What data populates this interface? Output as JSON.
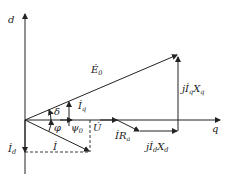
{
  "diagram": {
    "type": "phasor diagram",
    "axes": {
      "d_label": "d",
      "q_label": "q"
    },
    "phasors": [
      {
        "id": "E0",
        "label": "Ė",
        "sub": "0"
      },
      {
        "id": "jIqXq",
        "label": "jİ",
        "sub": "q",
        "suffix": "X",
        "suffix_sub": "q"
      },
      {
        "id": "U",
        "label": "U̇"
      },
      {
        "id": "I",
        "label": "İ"
      },
      {
        "id": "Id",
        "label": "İ",
        "sub": "d"
      },
      {
        "id": "Iq",
        "label": "İ",
        "sub": "q"
      },
      {
        "id": "IRa",
        "label": "İR",
        "sub": "a"
      },
      {
        "id": "jIdXd",
        "label": "jİ",
        "sub": "d",
        "suffix": "X",
        "suffix_sub": "d"
      }
    ],
    "angles": {
      "delta": "δ",
      "phi": "φ",
      "psi0": "ψ",
      "psi0_sub": "0"
    }
  }
}
